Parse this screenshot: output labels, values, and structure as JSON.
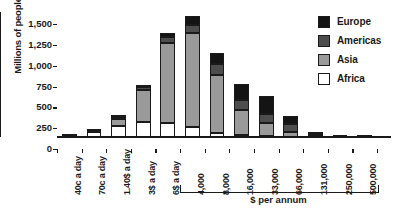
{
  "chart_data": {
    "type": "bar",
    "subtype": "stacked-bar",
    "title": "",
    "xlabel": "$ per annum",
    "ylabel": "Millions of people",
    "ylim": [
      0,
      1500
    ],
    "yticks": [
      0,
      250,
      500,
      750,
      1000,
      1250,
      1500
    ],
    "ytick_labels": [
      "0",
      "250",
      "500",
      "750",
      "1,000",
      "1,250",
      "1,500"
    ],
    "grid": false,
    "legend_position": "top-right",
    "categories": [
      "40c a day",
      "70c a day",
      "1.40$ a day",
      "3$ a day",
      "6$ a day",
      "4,000",
      "8,000",
      "16,000",
      "33,000",
      "66,000",
      "131,000",
      "250,000",
      "500,000"
    ],
    "series": [
      {
        "name": "Africa",
        "color": "#ffffff",
        "values": [
          10,
          55,
          130,
          175,
          170,
          120,
          45,
          20,
          8,
          3,
          1,
          0,
          0
        ]
      },
      {
        "name": "Asia",
        "color": "#9a9a9a",
        "values": [
          5,
          10,
          85,
          385,
          960,
          1125,
          700,
          300,
          165,
          55,
          12,
          2,
          0
        ]
      },
      {
        "name": "Americas",
        "color": "#4d4d4d",
        "values": [
          3,
          8,
          20,
          35,
          70,
          100,
          135,
          120,
          105,
          95,
          20,
          3,
          1
        ]
      },
      {
        "name": "Europe",
        "color": "#141414",
        "values": [
          2,
          7,
          10,
          20,
          50,
          105,
          125,
          200,
          220,
          95,
          17,
          3,
          1
        ]
      }
    ],
    "totals": [
      20,
      80,
      245,
      615,
      1250,
      1450,
      1005,
      640,
      498,
      248,
      50,
      8,
      2
    ],
    "annotations": [
      {
        "type": "bracket",
        "label": "$ per annum",
        "spans_categories": [
          "4,000",
          "500,000"
        ]
      }
    ]
  },
  "legend": {
    "items": [
      {
        "label": "Europe",
        "color": "#141414"
      },
      {
        "label": "Americas",
        "color": "#4d4d4d"
      },
      {
        "label": "Asia",
        "color": "#9a9a9a"
      },
      {
        "label": "Africa",
        "color": "#ffffff"
      }
    ]
  },
  "axes": {
    "y_title": "Millions of people",
    "x_bracket_caption": "$ per annum"
  },
  "colors": {
    "axis": "#141414",
    "europe": "#141414",
    "americas": "#4d4d4d",
    "asia": "#9a9a9a",
    "africa": "#ffffff"
  }
}
